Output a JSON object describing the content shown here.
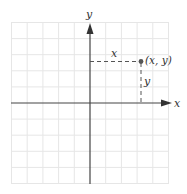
{
  "diagram": {
    "type": "cartesian-coordinate-plane",
    "grid": {
      "columns": 10,
      "rows": 10,
      "color": "#e6e6e6"
    },
    "axes": {
      "x_label": "x",
      "y_label": "y",
      "color": "#444444"
    },
    "point": {
      "label": "(x, y)",
      "grid_x": 3,
      "grid_y": 2,
      "color": "#555555"
    },
    "guides": {
      "horizontal_label": "x",
      "vertical_label": "y",
      "style": "dashed"
    }
  }
}
